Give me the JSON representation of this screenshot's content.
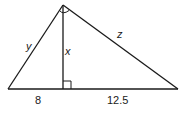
{
  "diagram": {
    "type": "right-triangle-with-altitude",
    "colors": {
      "stroke": "#1a1a1a",
      "background": "#ffffff"
    },
    "labels": {
      "leg_left": "y",
      "altitude": "x",
      "hypotenuse_right": "z",
      "base_left_segment": "8",
      "base_right_segment": "12.5"
    },
    "marks": {
      "apex_right_angle": "right-angle-arc",
      "altitude_foot_right_angle": "right-angle-square"
    }
  }
}
